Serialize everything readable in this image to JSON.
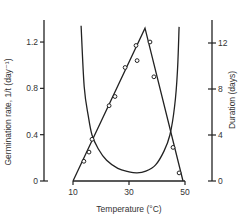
{
  "chart_data": {
    "type": "line",
    "title": "",
    "xlabel": "Temperature (°C)",
    "ylabel": "Germination rate, 1/t (day⁻¹)",
    "y2label": "Duration (days)",
    "xlim": [
      10,
      50
    ],
    "ylim": [
      0,
      1.44
    ],
    "y2lim": [
      0,
      14.4
    ],
    "x_ticks": [
      10,
      30,
      50
    ],
    "y_ticks": [
      0,
      0.4,
      0.8,
      1.2
    ],
    "y_tick_labels": [
      "0",
      "0.4",
      "0.8",
      "1.2"
    ],
    "y2_ticks": [
      0,
      4,
      8,
      12
    ],
    "y2_tick_labels": [
      "0",
      "4",
      "8",
      "12"
    ],
    "grid": false,
    "legend": "none",
    "series": [
      {
        "name": "Germination rate (observed)",
        "axis": "left",
        "style": "open-circle-markers",
        "points": [
          {
            "x": 13.9,
            "y": 0.17
          },
          {
            "x": 15.7,
            "y": 0.25
          },
          {
            "x": 16.8,
            "y": 0.36
          },
          {
            "x": 22.9,
            "y": 0.65
          },
          {
            "x": 25.0,
            "y": 0.73
          },
          {
            "x": 28.6,
            "y": 0.98
          },
          {
            "x": 32.5,
            "y": 1.17
          },
          {
            "x": 32.9,
            "y": 1.04
          },
          {
            "x": 37.5,
            "y": 1.2
          },
          {
            "x": 38.9,
            "y": 0.9
          },
          {
            "x": 45.7,
            "y": 0.29
          },
          {
            "x": 47.9,
            "y": 0.07
          }
        ]
      },
      {
        "name": "Germination rate (fitted linear model)",
        "axis": "left",
        "style": "line",
        "points": [
          {
            "x": 10.0,
            "y": 0.0
          },
          {
            "x": 35.7,
            "y": 1.32
          },
          {
            "x": 49.3,
            "y": 0.0
          }
        ]
      },
      {
        "name": "Duration (days)",
        "axis": "right",
        "style": "curve",
        "points": [
          {
            "x": 12.9,
            "y": 13.5
          },
          {
            "x": 14.0,
            "y": 8.2
          },
          {
            "x": 15.5,
            "y": 5.6
          },
          {
            "x": 16.8,
            "y": 4.0
          },
          {
            "x": 19.0,
            "y": 2.8
          },
          {
            "x": 22.0,
            "y": 1.8
          },
          {
            "x": 26.0,
            "y": 1.1
          },
          {
            "x": 30.0,
            "y": 0.8
          },
          {
            "x": 32.9,
            "y": 0.7
          },
          {
            "x": 36.0,
            "y": 0.85
          },
          {
            "x": 39.5,
            "y": 1.4
          },
          {
            "x": 42.5,
            "y": 2.6
          },
          {
            "x": 44.6,
            "y": 4.0
          },
          {
            "x": 46.3,
            "y": 6.5
          },
          {
            "x": 47.3,
            "y": 9.5
          },
          {
            "x": 47.9,
            "y": 13.4
          }
        ]
      }
    ]
  }
}
